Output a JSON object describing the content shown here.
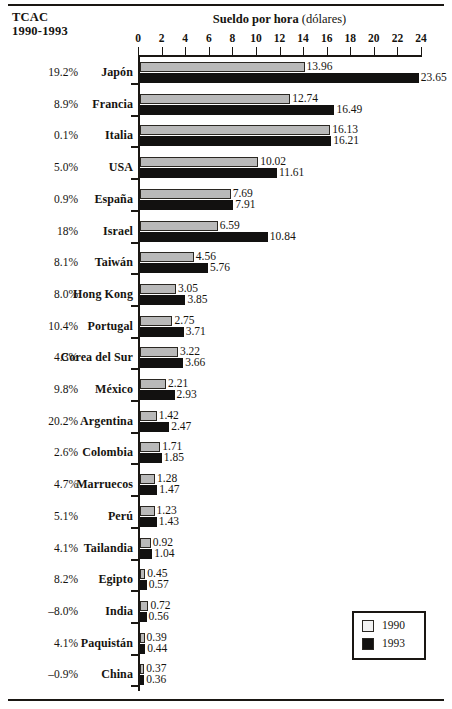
{
  "corner_header": {
    "line1": "TCAC",
    "line2": "1990-1993"
  },
  "title": {
    "main": "Sueldo por hora",
    "sub": "(dólares)"
  },
  "legend": {
    "items": [
      {
        "label": "1990",
        "color": "#f2f2f2"
      },
      {
        "label": "1993",
        "color": "#121110"
      }
    ]
  },
  "chart_data": {
    "type": "bar",
    "orientation": "horizontal",
    "title": "Sueldo por hora (dólares)",
    "xlabel": "",
    "ylabel": "",
    "xlim": [
      0,
      24
    ],
    "xticks": [
      0,
      2,
      4,
      6,
      8,
      10,
      12,
      14,
      16,
      18,
      20,
      22,
      24
    ],
    "grid": false,
    "legend_position": "bottom-right",
    "categories": [
      "Japón",
      "Francia",
      "Italia",
      "USA",
      "España",
      "Israel",
      "Taiwán",
      "Hong Kong",
      "Portugal",
      "Corea del Sur",
      "México",
      "Argentina",
      "Colombia",
      "Marruecos",
      "Perú",
      "Tailandia",
      "Egipto",
      "India",
      "Paquistán",
      "China"
    ],
    "series": [
      {
        "name": "1990",
        "color": "#b9b9b9",
        "values": [
          13.96,
          12.74,
          16.13,
          10.02,
          7.69,
          6.59,
          4.56,
          3.05,
          2.75,
          3.22,
          2.21,
          1.42,
          1.71,
          1.28,
          1.23,
          0.92,
          0.45,
          0.72,
          0.39,
          0.37
        ]
      },
      {
        "name": "1993",
        "color": "#121110",
        "values": [
          23.65,
          16.49,
          16.21,
          11.61,
          7.91,
          10.84,
          5.76,
          3.85,
          3.71,
          3.66,
          2.93,
          2.47,
          1.85,
          1.47,
          1.43,
          1.04,
          0.57,
          0.56,
          0.44,
          0.36
        ]
      }
    ],
    "annotations": {
      "row_header": "TCAC 1990-1993",
      "row_values": [
        "19.2%",
        "8.9%",
        "0.1%",
        "5.0%",
        "0.9%",
        "18%",
        "8.1%",
        "8.0%",
        "10.4%",
        "4.3%",
        "9.8%",
        "20.2%",
        "2.6%",
        "4.7%",
        "5.1%",
        "4.1%",
        "8.2%",
        "–8.0%",
        "4.1%",
        "–0.9%"
      ]
    }
  }
}
